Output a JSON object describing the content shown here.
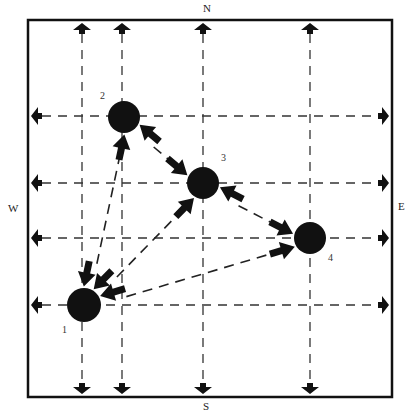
{
  "compass": {
    "north": "N",
    "south": "S",
    "west": "W",
    "east": "E"
  },
  "frame": {
    "left": 28,
    "top": 20,
    "right": 392,
    "bottom": 397
  },
  "grid": {
    "vertical_lines_x": [
      82,
      122,
      203,
      310
    ],
    "horizontal_lines_y": [
      116,
      183,
      238,
      305
    ]
  },
  "nodes": [
    {
      "id": "1",
      "label": "1",
      "x": 84,
      "y": 305,
      "r": 17,
      "label_x": 62,
      "label_y": 333
    },
    {
      "id": "2",
      "label": "2",
      "x": 124,
      "y": 117,
      "r": 16,
      "label_x": 100,
      "label_y": 99
    },
    {
      "id": "3",
      "label": "3",
      "x": 203,
      "y": 183,
      "r": 16,
      "label_x": 221,
      "label_y": 161
    },
    {
      "id": "4",
      "label": "4",
      "x": 310,
      "y": 238,
      "r": 16,
      "label_x": 328,
      "label_y": 261
    }
  ],
  "edges": [
    {
      "from": "1",
      "to": "2",
      "bidirectional": true
    },
    {
      "from": "1",
      "to": "3",
      "bidirectional": true
    },
    {
      "from": "1",
      "to": "4",
      "bidirectional": true
    },
    {
      "from": "2",
      "to": "3",
      "bidirectional": true
    },
    {
      "from": "3",
      "to": "4",
      "bidirectional": true
    }
  ],
  "colors": {
    "ink": "#111111",
    "background": "#ffffff"
  }
}
